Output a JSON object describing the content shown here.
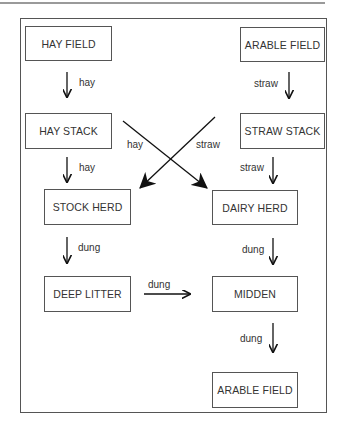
{
  "diagram": {
    "type": "flow",
    "nodes": [
      {
        "id": "hay_field",
        "label": "HAY FIELD"
      },
      {
        "id": "arable_field_top",
        "label": "ARABLE FIELD"
      },
      {
        "id": "hay_stack",
        "label": "HAY STACK"
      },
      {
        "id": "straw_stack",
        "label": "STRAW STACK"
      },
      {
        "id": "stock_herd",
        "label": "STOCK HERD"
      },
      {
        "id": "dairy_herd",
        "label": "DAIRY HERD"
      },
      {
        "id": "deep_litter",
        "label": "DEEP LITTER"
      },
      {
        "id": "midden",
        "label": "MIDDEN"
      },
      {
        "id": "arable_field_bottom",
        "label": "ARABLE FIELD"
      }
    ],
    "edges": [
      {
        "from": "hay_field",
        "to": "hay_stack",
        "label": "hay"
      },
      {
        "from": "arable_field_top",
        "to": "straw_stack",
        "label": "straw"
      },
      {
        "from": "hay_stack",
        "to": "stock_herd",
        "label": "hay"
      },
      {
        "from": "hay_stack",
        "to": "dairy_herd",
        "label": "hay"
      },
      {
        "from": "straw_stack",
        "to": "stock_herd",
        "label": "straw"
      },
      {
        "from": "straw_stack",
        "to": "dairy_herd",
        "label": "straw"
      },
      {
        "from": "stock_herd",
        "to": "deep_litter",
        "label": "dung"
      },
      {
        "from": "dairy_herd",
        "to": "midden",
        "label": "dung"
      },
      {
        "from": "deep_litter",
        "to": "midden",
        "label": "dung"
      },
      {
        "from": "midden",
        "to": "arable_field_bottom",
        "label": "dung"
      }
    ]
  }
}
